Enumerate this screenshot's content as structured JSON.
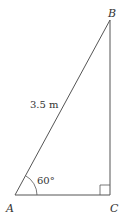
{
  "diagram": {
    "type": "right-triangle",
    "vertices": {
      "A": {
        "label": "A"
      },
      "B": {
        "label": "B"
      },
      "C": {
        "label": "C"
      }
    },
    "hypotenuse_label": "3.5 m",
    "angle_A_label": "60°",
    "right_angle_at": "C",
    "stroke_color": "#555555",
    "text_color": "#333333"
  }
}
